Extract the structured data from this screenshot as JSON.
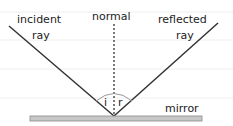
{
  "diagram": {
    "labels": {
      "incident_line1": "incident",
      "incident_line2": "ray",
      "normal": "normal",
      "reflected_line1": "reflected",
      "reflected_line2": "ray",
      "angle_i": "i",
      "angle_r": "r",
      "mirror": "mirror"
    },
    "colors": {
      "ray": "#333333",
      "mirror_fill": "#c8c8c8",
      "mirror_stroke": "#888888",
      "ruled_line": "#eeeeee"
    }
  }
}
